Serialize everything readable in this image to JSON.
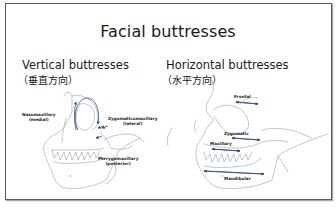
{
  "slide": {
    "title": "Facial buttresses",
    "left_panel": {
      "heading": "Vertical buttresses",
      "heading_jp": "（垂直方向）",
      "labels": [
        {
          "line1": "Nasomaxillary",
          "line2": "(medial)"
        },
        {
          "line1": "Zygomaticomaxillary",
          "line2": "(lateral)"
        },
        {
          "line1": "Pterygomaxillary",
          "line2": "(posterior)"
        }
      ]
    },
    "right_panel": {
      "heading": "Horizontal buttresses",
      "heading_jp": "（水平方向）",
      "labels": [
        {
          "line1": "Frontal"
        },
        {
          "line1": "Zygomatic"
        },
        {
          "line1": "Maxillary"
        },
        {
          "line1": "Mandibular"
        }
      ]
    },
    "colors": {
      "frame": "#5a5a5a",
      "text": "#1a1a1a",
      "sketch": "#9aa0a8",
      "arrow": "#2f4a7a"
    }
  }
}
